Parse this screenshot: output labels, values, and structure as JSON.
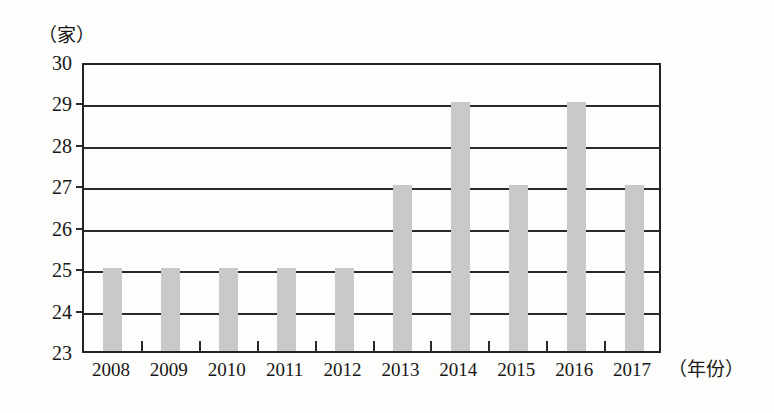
{
  "axes": {
    "y_unit": "（家）",
    "x_unit": "（年份）"
  },
  "chart_data": {
    "type": "bar",
    "title": "",
    "subtitle": "",
    "xlabel": "（年份）",
    "ylabel": "（家）",
    "categories": [
      "2008",
      "2009",
      "2010",
      "2011",
      "2012",
      "2013",
      "2014",
      "2015",
      "2016",
      "2017"
    ],
    "values": [
      25,
      25,
      25,
      25,
      25,
      27,
      29,
      27,
      29,
      27
    ],
    "ylim": [
      23,
      30
    ],
    "ytick_labels": [
      "23",
      "24",
      "25",
      "26",
      "27",
      "28",
      "29",
      "30"
    ],
    "ytick_step": 1,
    "grid": true,
    "grid_axis": "y",
    "legend": false,
    "legend_position": "none",
    "bar_color": "#c9c9c9",
    "axis_color": "#232323",
    "background_color": "#fdfdfb"
  }
}
